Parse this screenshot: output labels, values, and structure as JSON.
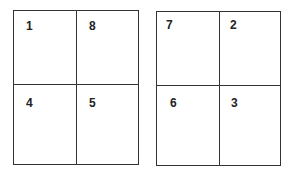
{
  "diagram": {
    "sheets": [
      {
        "name": "left-sheet",
        "quadrants": {
          "top_left": "1",
          "top_right": "8",
          "bottom_left": "4",
          "bottom_right": "5"
        }
      },
      {
        "name": "right-sheet",
        "quadrants": {
          "top_left": "7",
          "top_right": "2",
          "bottom_left": "6",
          "bottom_right": "3"
        }
      }
    ]
  }
}
